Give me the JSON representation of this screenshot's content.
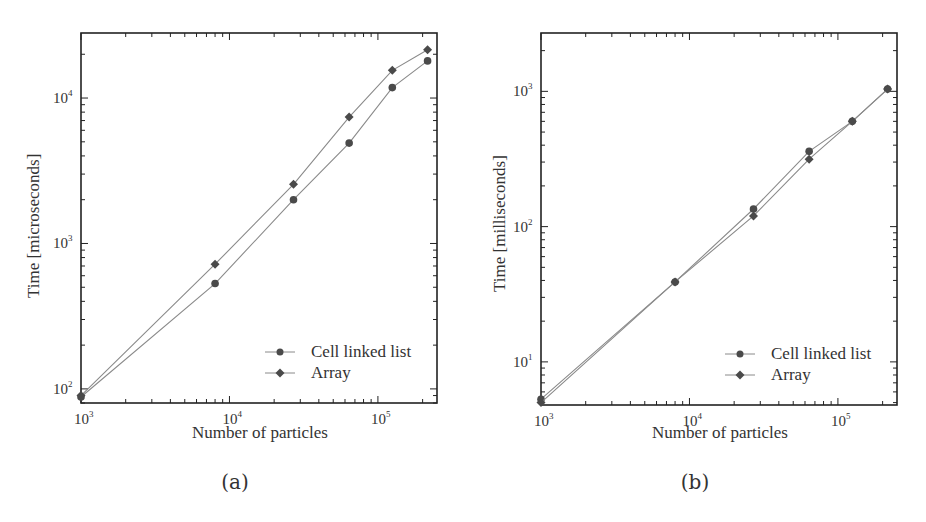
{
  "chart_data": [
    {
      "id": "a",
      "type": "line",
      "caption": "(a)",
      "title": "",
      "xlabel": "Number of particles",
      "ylabel": "Time [microseconds]",
      "xscale": "log",
      "yscale": "log",
      "xlim": [
        1000,
        250000
      ],
      "ylim": [
        80,
        28000
      ],
      "xticks": [
        "10^3",
        "10^4",
        "10^5"
      ],
      "yticks": [
        "10^2",
        "10^3",
        "10^4"
      ],
      "grid": false,
      "legend_position": "lower right",
      "x": [
        1000,
        8000,
        27000,
        64000,
        125000,
        216000
      ],
      "series": [
        {
          "name": "Cell linked list",
          "marker": "circle",
          "values": [
            88,
            530,
            2000,
            4900,
            11800,
            18000
          ]
        },
        {
          "name": "Array",
          "marker": "diamond",
          "values": [
            90,
            720,
            2550,
            7400,
            15500,
            21500
          ]
        }
      ]
    },
    {
      "id": "b",
      "type": "line",
      "caption": "(b)",
      "title": "",
      "xlabel": "Number of particles",
      "ylabel": "Time [milliseconds]",
      "xscale": "log",
      "yscale": "log",
      "xlim": [
        1000,
        250000
      ],
      "ylim": [
        4.8,
        2700
      ],
      "xticks": [
        "10^3",
        "10^4",
        "10^5"
      ],
      "yticks": [
        "10^1",
        "10^2",
        "10^3"
      ],
      "grid": false,
      "legend_position": "lower right",
      "x": [
        1000,
        8000,
        27000,
        64000,
        125000,
        216000
      ],
      "series": [
        {
          "name": "Cell linked list",
          "marker": "circle",
          "values": [
            5.3,
            39,
            135,
            360,
            600,
            1040
          ]
        },
        {
          "name": "Array",
          "marker": "diamond",
          "values": [
            5.0,
            39,
            120,
            315,
            600,
            1040
          ]
        }
      ]
    }
  ],
  "panels": {
    "a": {
      "caption": "(a)",
      "xlabel": "Number of particles",
      "ylabel": "Time [microseconds]",
      "legend": [
        "Cell linked list",
        "Array"
      ]
    },
    "b": {
      "caption": "(b)",
      "xlabel": "Number of particles",
      "ylabel": "Time [milliseconds]",
      "legend": [
        "Cell linked list",
        "Array"
      ]
    }
  },
  "style": {
    "line_color": "#8a8a8a",
    "marker_color": "#4a4a4a",
    "axis_color": "#222222"
  }
}
